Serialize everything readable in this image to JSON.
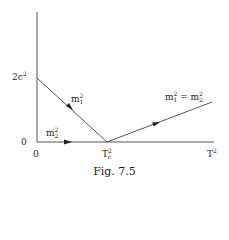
{
  "diagram": {
    "axes": {
      "y_tick_top": {
        "base": "2c",
        "sup": "2"
      },
      "y_tick_zero": "0",
      "x_tick_zero": "0",
      "x_tick_mid": {
        "base": "T",
        "sup": "2",
        "sub": "c"
      },
      "x_axis_label": {
        "base": "T",
        "sup": "2"
      }
    },
    "curves": [
      {
        "label": {
          "base": "m",
          "sup": "2",
          "sub": "1"
        },
        "from": [
          0,
          "2c^2"
        ],
        "to": [
          "T_c^2",
          0
        ]
      },
      {
        "label": {
          "base": "m",
          "sup": "2",
          "sub": "2"
        },
        "from": [
          0,
          0
        ],
        "to": [
          "T_c^2",
          0
        ]
      },
      {
        "label_text": "m₁² = m₂²",
        "from": [
          "T_c^2",
          0
        ],
        "to": [
          "T^2",
          "rising"
        ]
      }
    ],
    "right_label": {
      "left": {
        "base": "m",
        "sup": "2",
        "sub": "1"
      },
      "eq": "=",
      "right": {
        "base": "m",
        "sup": "2",
        "sub": "2"
      }
    },
    "caption": "Fig. 7.5"
  }
}
